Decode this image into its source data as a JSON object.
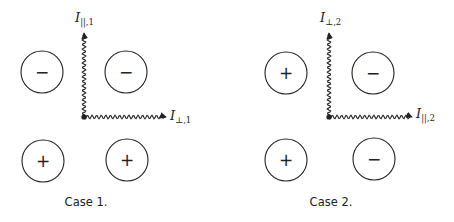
{
  "diagram": {
    "panels": [
      {
        "caption": "Case 1.",
        "origin": [
          84,
          117
        ],
        "vertical_axis": {
          "label_main": "I",
          "label_sub": "||,1",
          "top_y": 33
        },
        "horizontal_axis": {
          "label_main": "I",
          "label_sub": "⊥,1",
          "end_x": 166
        },
        "charges": [
          {
            "position": "top-left",
            "cx": 42,
            "cy": 72,
            "sign": "−"
          },
          {
            "position": "top-right",
            "cx": 126,
            "cy": 72,
            "sign": "−"
          },
          {
            "position": "bottom-left",
            "cx": 43,
            "cy": 161,
            "sign": "+"
          },
          {
            "position": "bottom-right",
            "cx": 127,
            "cy": 160,
            "sign": "+"
          }
        ]
      },
      {
        "caption": "Case 2.",
        "origin": [
          329,
          117
        ],
        "vertical_axis": {
          "label_main": "I",
          "label_sub": "⊥,2",
          "top_y": 33
        },
        "horizontal_axis": {
          "label_main": "I",
          "label_sub": "||,2",
          "end_x": 412
        },
        "charges": [
          {
            "position": "top-left",
            "cx": 286,
            "cy": 73,
            "sign": "+"
          },
          {
            "position": "top-right",
            "cx": 373,
            "cy": 73,
            "sign": "−"
          },
          {
            "position": "bottom-left",
            "cx": 286,
            "cy": 160,
            "sign": "+"
          },
          {
            "position": "bottom-right",
            "cx": 374,
            "cy": 159,
            "sign": "−"
          }
        ]
      }
    ],
    "circle_radius": 21,
    "stroke_color": "#222222"
  }
}
